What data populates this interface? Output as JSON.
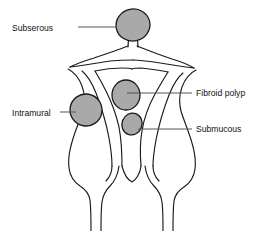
{
  "diagram": {
    "type": "anatomical-line-diagram",
    "background_color": "#ffffff",
    "outline_color": "#1a1a1a",
    "fibroid_fill_color": "#a9a9a9",
    "leader_line_color": "#555555",
    "text_color": "#111111"
  },
  "labels": {
    "subserous": "Subserous",
    "intramural": "Intramural",
    "fibroid_polyp": "Fibroid polyp",
    "submucous": "Submucous"
  },
  "fibroids": [
    {
      "name": "subserous",
      "label": "Subserous",
      "shape": "ellipse",
      "cx": 133,
      "cy": 25,
      "rx": 17,
      "ry": 16,
      "rotation": -12,
      "pedunculated": true,
      "leader_from_x": 78,
      "leader_to_x": 116,
      "leader_y": 27
    },
    {
      "name": "fibroid-polyp",
      "label": "Fibroid polyp",
      "shape": "ellipse",
      "cx": 126,
      "cy": 95,
      "rx": 14,
      "ry": 15,
      "rotation": 0,
      "pedunculated": false,
      "leader_from_x": 139,
      "leader_to_x": 192,
      "leader_y": 93
    },
    {
      "name": "submucous",
      "label": "Submucous",
      "shape": "ellipse",
      "cx": 132,
      "cy": 124,
      "rx": 10,
      "ry": 11,
      "rotation": 20,
      "pedunculated": false,
      "leader_from_x": 142,
      "leader_to_x": 192,
      "leader_y": 129
    },
    {
      "name": "intramural",
      "label": "Intramural",
      "shape": "ellipse",
      "cx": 86,
      "cy": 110,
      "rx": 16,
      "ry": 16,
      "rotation": 10,
      "pedunculated": false,
      "leader_from_x": 60,
      "leader_to_x": 74,
      "leader_y": 112
    }
  ]
}
